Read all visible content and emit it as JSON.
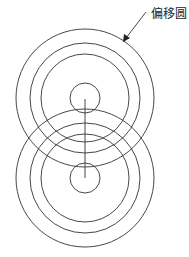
{
  "diagram": {
    "annotation_label": "偏移圆",
    "stroke_color": "#333333",
    "circle_groups": [
      {
        "name": "upper",
        "rings": 4
      },
      {
        "name": "lower",
        "rings": 4
      }
    ]
  }
}
